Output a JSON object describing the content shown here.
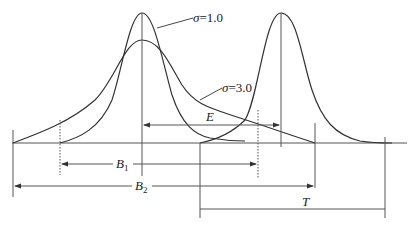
{
  "figure": {
    "line_color": "#333333",
    "labels": {
      "sigma1": {
        "symbol": "σ",
        "eq": "=",
        "value": "1.0"
      },
      "sigma3": {
        "symbol": "σ",
        "eq": "=",
        "value": "3.0"
      },
      "E": "E",
      "B1": {
        "letter": "B",
        "sub": "1"
      },
      "B2": {
        "letter": "B",
        "sub": "2"
      },
      "T": "T"
    }
  }
}
